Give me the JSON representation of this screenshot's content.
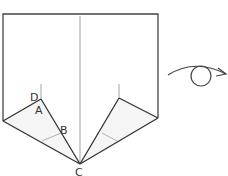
{
  "diagram": {
    "type": "origami-fold-step",
    "labels": {
      "d": "D",
      "a": "A",
      "b": "B",
      "c": "C"
    },
    "symbol": "turn-over-icon",
    "colors": {
      "line": "#333333",
      "crease": "#888888",
      "fill": "#ffffff",
      "shade": "#f4f4f4"
    }
  }
}
